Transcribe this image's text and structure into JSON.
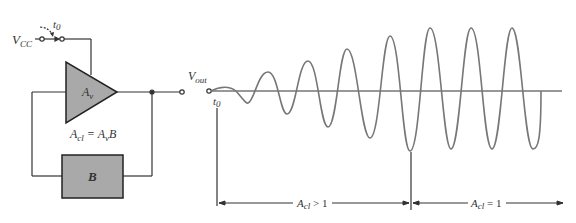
{
  "circuit": {
    "supply_label": "V",
    "supply_sub": "CC",
    "switch_time_label": "t",
    "switch_time_sub": "0",
    "amplifier_label": "A",
    "amplifier_sub": "v",
    "feedback_label": "B",
    "gain_eq_lhs": "A",
    "gain_eq_lhs_sub": "cl",
    "gain_eq_rhs": " = A",
    "gain_eq_rhs_sub": "v",
    "gain_eq_rhs_tail": "B",
    "output_label": "V",
    "output_sub": "out"
  },
  "waveform": {
    "start_label": "t",
    "start_sub": "0",
    "region1_label": "A",
    "region1_sub": "cl",
    "region1_tail": " > 1",
    "region2_label": "A",
    "region2_sub": "cl",
    "region2_tail": " = 1"
  },
  "colors": {
    "fill_gray": "#a9a9a9",
    "line": "#333333",
    "wave": "#777777"
  }
}
